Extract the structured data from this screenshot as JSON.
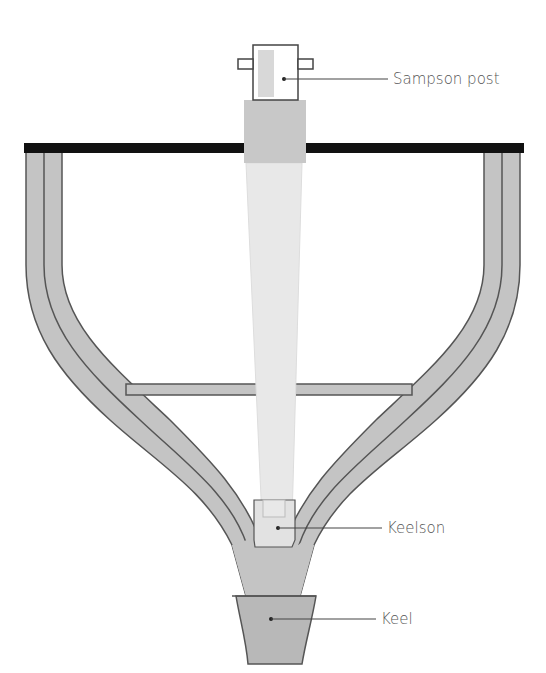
{
  "diagram": {
    "labels": [
      {
        "id": "sampson-post",
        "text": "Sampson post"
      },
      {
        "id": "keelson",
        "text": "Keelson"
      },
      {
        "id": "keel",
        "text": "Keel"
      }
    ],
    "colors": {
      "deck": "#111111",
      "hull": "#c4c4c4",
      "outline": "#555555",
      "mast": "#e8e8e8",
      "post_collar": "#c8c8c8",
      "keel": "#b8b8b8",
      "text": "#555555"
    }
  }
}
